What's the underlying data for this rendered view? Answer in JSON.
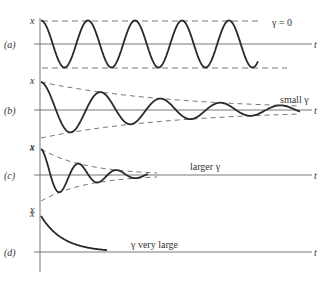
{
  "figure": {
    "panels": [
      {
        "id": "a",
        "tag": "(a)",
        "annotation": "γ = 0",
        "x_label": "x",
        "t_label": "t"
      },
      {
        "id": "b",
        "tag": "(b)",
        "annotation": "small γ",
        "x_label": "x",
        "t_label": "t"
      },
      {
        "id": "c",
        "tag": "(c)",
        "annotation": "larger γ",
        "x_label": "x",
        "t_label": "t"
      },
      {
        "id": "d",
        "tag": "(d)",
        "annotation": "γ very large",
        "x_label": "x",
        "t_label": "t"
      }
    ]
  },
  "colors": {
    "curve": "#2a2a2a",
    "axis": "#555555",
    "envelope": "#555555"
  }
}
